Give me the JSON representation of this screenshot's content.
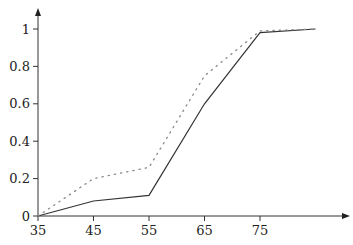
{
  "chart_data": {
    "type": "line",
    "title": "",
    "xlabel": "",
    "ylabel": "",
    "x": [
      35,
      45,
      55,
      65,
      75,
      85
    ],
    "x_ticks": [
      "35",
      "45",
      "55",
      "65",
      "75"
    ],
    "y_ticks": [
      "0",
      "0.2",
      "0.4",
      "0.6",
      "0.8",
      "1"
    ],
    "xlim": [
      35,
      90
    ],
    "ylim": [
      0,
      1.05
    ],
    "grid": false,
    "legend": null,
    "series": [
      {
        "name": "solid",
        "style": "solid",
        "color": "#333333",
        "values": [
          0,
          0.08,
          0.11,
          0.6,
          0.98,
          1.0
        ]
      },
      {
        "name": "dotted",
        "style": "dotted",
        "color": "#888888",
        "values": [
          0,
          0.2,
          0.26,
          0.75,
          0.99,
          1.0
        ]
      }
    ]
  }
}
